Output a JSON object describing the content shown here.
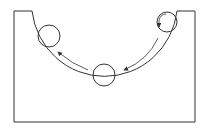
{
  "diagram": {
    "stroke_color": "#333333",
    "background": "#ffffff",
    "balls": [
      {
        "position": "upper-right",
        "cx": 167,
        "cy": 22,
        "r": 10,
        "rotation_arrow": true
      },
      {
        "position": "bottom",
        "cx": 104,
        "cy": 75,
        "r": 11
      },
      {
        "position": "upper-left",
        "cx": 49,
        "cy": 36,
        "r": 11
      }
    ],
    "arrows": [
      {
        "from": "upper-right",
        "to": "bottom"
      },
      {
        "from": "bottom",
        "to": "upper-left"
      }
    ]
  }
}
